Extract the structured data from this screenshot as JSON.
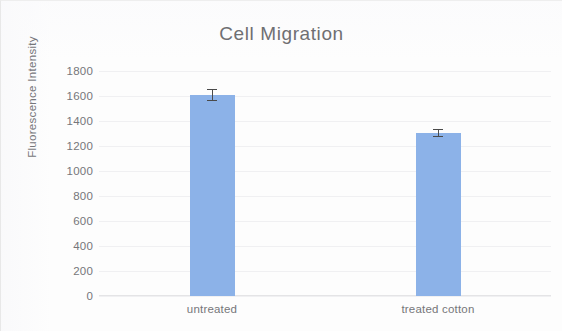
{
  "chart_data": {
    "type": "bar",
    "title": "Cell Migration",
    "xlabel": "",
    "ylabel": "Fluorescence Intensity",
    "categories": [
      "untreated",
      "treated cotton"
    ],
    "values": [
      1610,
      1305
    ],
    "errors": [
      45,
      28
    ],
    "series": [
      {
        "name": "Fluorescence Intensity",
        "values": [
          1610,
          1305
        ],
        "errors": [
          45,
          28
        ]
      }
    ],
    "ylim": [
      0,
      1800
    ],
    "ytick_labels": [
      "1800",
      "1600",
      "1400",
      "1200",
      "1000",
      "800",
      "600",
      "400",
      "200",
      "0"
    ],
    "ytick_values": [
      1800,
      1600,
      1400,
      1200,
      1000,
      800,
      600,
      400,
      200,
      0
    ],
    "grid": true,
    "legend": false,
    "bar_color": "#8cb2e8",
    "error_color": "#4a4a4a",
    "title_color": "#6f6f72",
    "label_color": "#76767a",
    "gridline_color": "#f0f0f2",
    "background_color": "#fdfdfd"
  }
}
